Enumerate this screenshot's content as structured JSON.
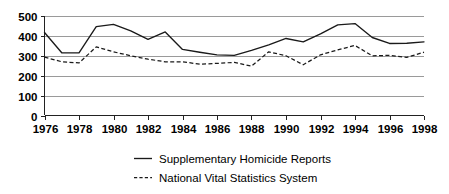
{
  "chart_data": {
    "type": "line",
    "title": "",
    "subtitle": "",
    "xlabel": "",
    "ylabel": "",
    "xlim": [
      1976,
      1998
    ],
    "ylim": [
      0,
      500
    ],
    "grid": true,
    "grid_axis": "y",
    "legend_position": "bottom-center",
    "y_ticks": [
      0,
      100,
      200,
      300,
      400,
      500
    ],
    "y_tick_labels": [
      "0",
      "100",
      "200",
      "300",
      "400",
      "500"
    ],
    "x_ticks": [
      1976,
      1978,
      1980,
      1982,
      1984,
      1986,
      1988,
      1990,
      1992,
      1994,
      1996,
      1998
    ],
    "x_tick_labels": [
      "1976",
      "1978",
      "1980",
      "1982",
      "1984",
      "1986",
      "1988",
      "1990",
      "1992",
      "1994",
      "1996",
      "1998"
    ],
    "x": [
      1976,
      1977,
      1978,
      1979,
      1980,
      1981,
      1982,
      1983,
      1984,
      1985,
      1986,
      1987,
      1988,
      1989,
      1990,
      1991,
      1992,
      1993,
      1994,
      1995,
      1996,
      1997,
      1998
    ],
    "series": [
      {
        "name": "Supplementary Homicide Reports",
        "style": "solid",
        "color": "#1a1a1a",
        "values": [
          417,
          315,
          315,
          447,
          458,
          425,
          383,
          420,
          332,
          318,
          305,
          302,
          327,
          355,
          387,
          370,
          410,
          455,
          462,
          392,
          362,
          363,
          370
        ]
      },
      {
        "name": "National Vital Statistics System",
        "style": "dashed",
        "color": "#1a1a1a",
        "values": [
          293,
          270,
          264,
          345,
          320,
          300,
          283,
          270,
          270,
          258,
          262,
          267,
          248,
          320,
          300,
          255,
          305,
          330,
          352,
          300,
          302,
          292,
          318
        ]
      }
    ]
  },
  "legend": {
    "entries": [
      {
        "label": "Supplementary Homicide Reports",
        "style": "solid"
      },
      {
        "label": "National Vital Statistics System",
        "style": "dashed"
      }
    ]
  }
}
